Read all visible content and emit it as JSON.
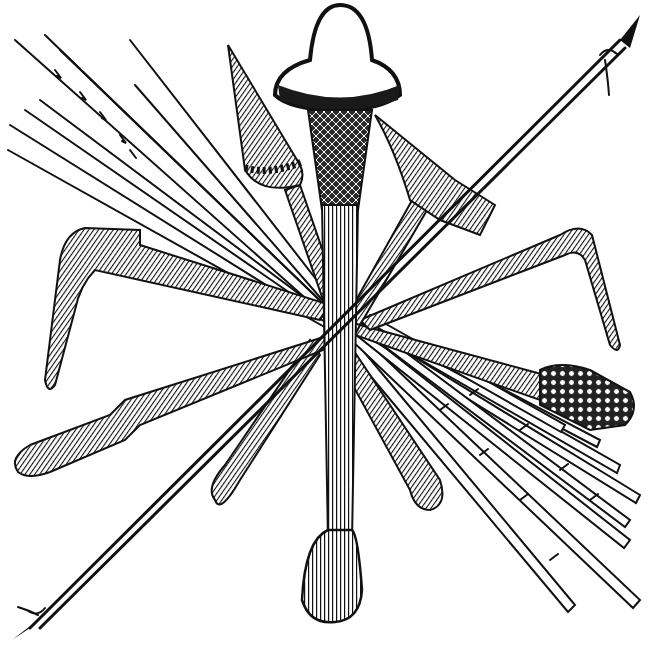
{
  "image": {
    "description": "Engraving of crossed ethnographic weapons: clubs, spears, arrows, boomerangs",
    "width": 647,
    "height": 650,
    "colors": {
      "background": "#ffffff",
      "ink": "#111111",
      "shade": "#1a1a1a"
    }
  },
  "objects": {
    "central_club": {
      "label": "Central mushroom-headed club",
      "cap": [
        338,
        75
      ],
      "grip_bottom": [
        330,
        620
      ]
    },
    "cone_club": {
      "label": "Conical-headed club",
      "tip": [
        228,
        45
      ],
      "collar": [
        275,
        175
      ]
    },
    "hammer_club": {
      "label": "Hammer-headed club",
      "head": [
        440,
        175
      ]
    },
    "long_spear": {
      "label": "Long diagonal spear",
      "from": [
        20,
        635
      ],
      "to": [
        640,
        15
      ]
    },
    "left_boomerang": {
      "label": "Left boomerang",
      "elbow": [
        70,
        240
      ]
    },
    "right_boomerang": {
      "label": "Right boomerang",
      "elbow": [
        590,
        220
      ]
    },
    "left_club": {
      "label": "Left paddle club",
      "end": [
        20,
        465
      ]
    },
    "right_club": {
      "label": "Right knobbed club",
      "knob": [
        590,
        395
      ]
    },
    "lower_clubs": {
      "label": "Lower teardrop clubs",
      "left_end": [
        225,
        505
      ],
      "right_end": [
        430,
        505
      ]
    },
    "arrow_bundle_top": {
      "label": "Upper-left barbed arrow bundle",
      "count": 9
    },
    "arrow_bundle_bottom": {
      "label": "Lower-right jointed arrow bundle",
      "count": 8
    }
  }
}
